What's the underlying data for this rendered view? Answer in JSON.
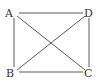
{
  "diagram": {
    "type": "quadrilateral-with-diagonals",
    "vertices": [
      {
        "label": "A",
        "x": 14,
        "y": 13,
        "lx": 4,
        "ly": 16
      },
      {
        "label": "D",
        "x": 88,
        "y": 13,
        "lx": 84,
        "ly": 16
      },
      {
        "label": "B",
        "x": 14,
        "y": 72,
        "lx": 4,
        "ly": 76
      },
      {
        "label": "C",
        "x": 88,
        "y": 72,
        "lx": 84,
        "ly": 76
      }
    ],
    "edges": [
      {
        "from": "A",
        "to": "D"
      },
      {
        "from": "A",
        "to": "B"
      },
      {
        "from": "D",
        "to": "C"
      },
      {
        "from": "B",
        "to": "C"
      },
      {
        "from": "A",
        "to": "C"
      },
      {
        "from": "B",
        "to": "D"
      }
    ],
    "line_color": "#5a5a5a",
    "label_color": "#333333"
  }
}
